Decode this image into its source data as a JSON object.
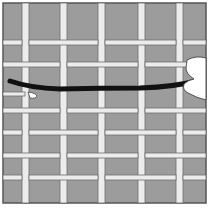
{
  "illustration": {
    "title": "Weaving a strand through a grid",
    "colors": {
      "background": "#9c9c9c",
      "strip": "#ececec",
      "strip_outline": "#6e6e6e",
      "strand": "#111111",
      "frame": "#555555",
      "hand": "#ffffff"
    },
    "vertical_strips_x": [
      25,
      63,
      101,
      141,
      179
    ],
    "horizontal_strips_y": [
      42,
      64,
      110,
      132,
      155,
      177
    ],
    "strand_y": 87
  }
}
